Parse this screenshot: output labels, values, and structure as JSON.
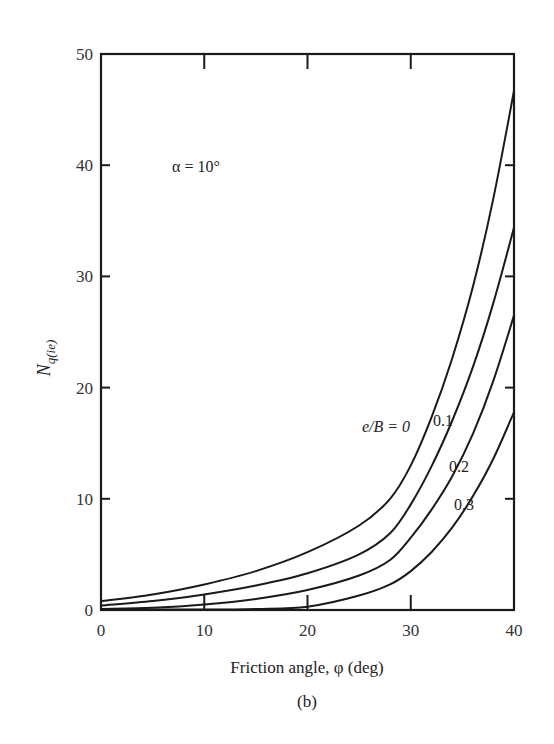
{
  "chart_data": {
    "type": "line",
    "title": "",
    "panel_label": "(b)",
    "annotation": "α = 10°",
    "xlabel": "Friction angle, φ (deg)",
    "ylabel": "N_q(ie)",
    "ylabel_main": "N",
    "ylabel_sub": "q(ie)",
    "xlim": [
      0,
      40
    ],
    "ylim": [
      0,
      50
    ],
    "xticks": [
      0,
      10,
      20,
      30,
      40
    ],
    "yticks": [
      0,
      10,
      20,
      30,
      40,
      50
    ],
    "grid": false,
    "legend_position": "inline curve labels",
    "x": [
      0,
      5,
      10,
      15,
      20,
      25,
      28,
      30,
      32,
      34,
      36,
      38,
      40
    ],
    "series": [
      {
        "name": "e/B = 0",
        "label": "e/B = 0",
        "values": [
          0.8,
          1.4,
          2.3,
          3.5,
          5.2,
          7.6,
          10.0,
          13.0,
          17.3,
          22.6,
          29.0,
          37.0,
          46.7
        ]
      },
      {
        "name": "e/B = 0.1",
        "label": "0.1",
        "values": [
          0.4,
          0.8,
          1.4,
          2.2,
          3.3,
          5.0,
          6.9,
          9.5,
          12.9,
          17.0,
          21.8,
          27.6,
          34.4
        ]
      },
      {
        "name": "e/B = 0.2",
        "label": "0.2",
        "values": [
          0.1,
          0.2,
          0.5,
          1.0,
          1.8,
          3.1,
          4.5,
          6.5,
          9.0,
          12.0,
          15.8,
          20.6,
          26.5
        ]
      },
      {
        "name": "e/B = 0.3",
        "label": "0.3",
        "values": [
          0.0,
          0.0,
          0.0,
          0.1,
          0.3,
          1.3,
          2.3,
          3.5,
          5.2,
          7.4,
          10.2,
          13.6,
          17.8
        ]
      }
    ]
  }
}
